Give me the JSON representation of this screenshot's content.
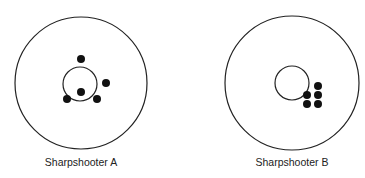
{
  "targets": [
    {
      "label": "Sharpshooter A",
      "cx": 81,
      "cy": 83,
      "outer_r": 66,
      "inner_r": 17,
      "shots": [
        [
          81,
          59
        ],
        [
          106,
          83
        ],
        [
          81,
          92
        ],
        [
          67,
          99
        ],
        [
          97,
          99
        ]
      ]
    },
    {
      "label": "Sharpshooter B",
      "cx": 292,
      "cy": 83,
      "outer_r": 67,
      "inner_r": 17,
      "shots": [
        [
          318,
          86
        ],
        [
          307,
          95
        ],
        [
          318,
          95
        ],
        [
          307,
          104
        ],
        [
          318,
          104
        ]
      ]
    }
  ]
}
